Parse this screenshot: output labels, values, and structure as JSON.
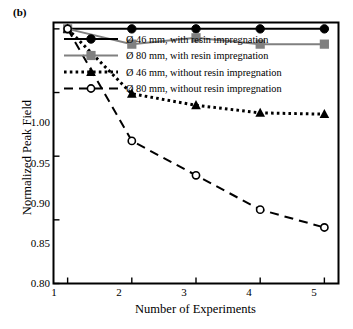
{
  "figure": {
    "panel_label": "(b)",
    "xlabel": "Number of Experiments",
    "ylabel": "Normalized Peak Field"
  },
  "axes": {
    "ytick_labels": [
      "1.00",
      "0.95",
      "0.90",
      "0.85",
      "0.80"
    ],
    "xtick_labels": [
      "1",
      "2",
      "3",
      "4",
      "5"
    ]
  },
  "legend": {
    "items": [
      {
        "label": "Ø 46 mm, with resin impregnation"
      },
      {
        "label": "Ø 80 mm, with resin impregnation"
      },
      {
        "label": "Ø 46 mm, without resin impregnation"
      },
      {
        "label": "Ø 80 mm, without resin impregnation"
      }
    ]
  },
  "colors": {
    "black": "#000000",
    "gray": "#808080",
    "frame": "#000000",
    "background": "#ffffff"
  },
  "chart_data": {
    "type": "line",
    "title": "",
    "xlabel": "Number of Experiments",
    "ylabel": "Normalized Peak Field",
    "x": [
      1,
      2,
      3,
      4,
      5
    ],
    "xlim": [
      0.78,
      5.22
    ],
    "ylim": [
      0.8,
      1.005
    ],
    "xticks": [
      1,
      2,
      3,
      4,
      5
    ],
    "yticks": [
      0.8,
      0.85,
      0.9,
      0.95,
      1.0
    ],
    "grid": false,
    "legend_position": "upper-left-inside",
    "series": [
      {
        "name": "Ø 46 mm, with resin impregnation",
        "values": [
          1.0,
          1.0,
          1.0,
          1.0,
          1.0
        ],
        "color": "#000000",
        "linestyle": "solid",
        "marker": "circle-filled"
      },
      {
        "name": "Ø 80 mm, with resin impregnation",
        "values": [
          1.0,
          0.988,
          0.993,
          0.988,
          0.988
        ],
        "color": "#808080",
        "linestyle": "solid",
        "marker": "square-filled"
      },
      {
        "name": "Ø 46 mm, without resin impregnation",
        "values": [
          1.0,
          0.949,
          0.94,
          0.934,
          0.933
        ],
        "color": "#000000",
        "linestyle": "dotted",
        "marker": "triangle-filled"
      },
      {
        "name": "Ø 80 mm, without resin impregnation",
        "values": [
          1.0,
          0.912,
          0.885,
          0.858,
          0.844
        ],
        "color": "#000000",
        "linestyle": "dashed",
        "marker": "circle-open"
      }
    ]
  }
}
